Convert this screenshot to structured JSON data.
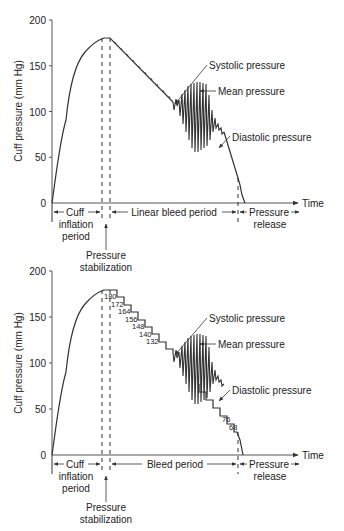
{
  "figure": {
    "top": {
      "y_axis_label": "Cuff pressure (mm Hg)",
      "y_ticks": [
        "200",
        "150",
        "100",
        "50",
        "0"
      ],
      "x_axis_label": "Time",
      "annotations": {
        "systolic": "Systolic pressure",
        "mean": "Mean pressure",
        "diastolic": "Diastolic pressure"
      },
      "periods": {
        "cuff_1": "Cuff",
        "cuff_2": "inflation",
        "cuff_3": "period",
        "bleed": "Linear bleed period",
        "release_1": "Pressure",
        "release_2": "release",
        "stab_1": "Pressure",
        "stab_2": "stabilization"
      }
    },
    "bottom": {
      "y_axis_label": "Cuff pressure (mm Hg)",
      "y_ticks": [
        "200",
        "150",
        "100",
        "50",
        "0"
      ],
      "x_axis_label": "Time",
      "step_labels": [
        "180",
        "172",
        "164",
        "156",
        "148",
        "140",
        "132",
        "76",
        "68"
      ],
      "annotations": {
        "systolic": "Systolic pressure",
        "mean": "Mean pressure",
        "diastolic": "Diastolic pressure"
      },
      "periods": {
        "cuff_1": "Cuff",
        "cuff_2": "inflation",
        "cuff_3": "period",
        "bleed": "Bleed period",
        "release_1": "Pressure",
        "release_2": "release",
        "stab_1": "Pressure",
        "stab_2": "stabilization"
      }
    }
  },
  "colors": {
    "ink": "#333333",
    "background": "#ffffff"
  }
}
